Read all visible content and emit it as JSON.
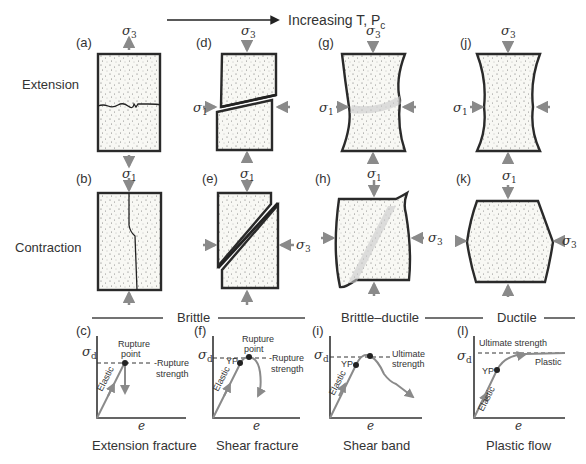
{
  "header": {
    "arrow_label": "Increasing T, P",
    "arrow_label_sub": "c"
  },
  "rows": {
    "extension": "Extension",
    "contraction": "Contraction"
  },
  "panels": {
    "a": "(a)",
    "b": "(b)",
    "c": "(c)",
    "d": "(d)",
    "e": "(e)",
    "f": "(f)",
    "g": "(g)",
    "h": "(h)",
    "i": "(i)",
    "j": "(j)",
    "k": "(k)",
    "l": "(l)"
  },
  "stress": {
    "sigma": "σ",
    "s1": "1",
    "s3": "3",
    "sd": "d"
  },
  "regimes": {
    "brittle": "Brittle",
    "brittle_ductile": "Brittle–ductile",
    "ductile": "Ductile"
  },
  "graphs": {
    "x_label": "e",
    "elastic": "Elastic",
    "yp": "YP",
    "c": {
      "point1": "Rupture",
      "point2": "point",
      "strength1": "-Rupture",
      "strength2": "strength",
      "caption": "Extension fracture"
    },
    "f": {
      "point1": "Rupture",
      "point2": "point",
      "strength1": "-Rupture",
      "strength2": "strength",
      "caption": "Shear fracture"
    },
    "i": {
      "strength1": "Ultimate",
      "strength2": "strength",
      "caption": "Shear band"
    },
    "l": {
      "strength": "Ultimate strength",
      "plastic": "Plastic",
      "caption": "Plastic flow"
    }
  }
}
